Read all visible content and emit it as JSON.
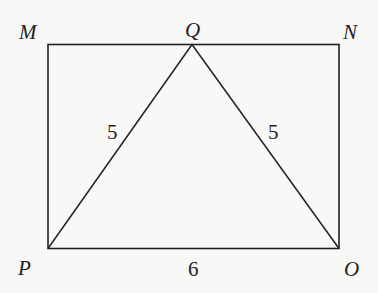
{
  "diagram": {
    "type": "geometry",
    "stroke_color": "#222222",
    "background_color": "#f8f8f6",
    "vertices": {
      "M": {
        "label": "M",
        "x": 48,
        "y": 44
      },
      "Q": {
        "label": "Q",
        "x": 192,
        "y": 44
      },
      "N": {
        "label": "N",
        "x": 339,
        "y": 44
      },
      "P": {
        "label": "P",
        "x": 48,
        "y": 248
      },
      "O": {
        "label": "O",
        "x": 339,
        "y": 248
      }
    },
    "segments": [
      {
        "from": "M",
        "to": "N",
        "role": "rectangle-top"
      },
      {
        "from": "N",
        "to": "O",
        "role": "rectangle-right"
      },
      {
        "from": "O",
        "to": "P",
        "role": "rectangle-bottom"
      },
      {
        "from": "P",
        "to": "M",
        "role": "rectangle-left"
      },
      {
        "from": "P",
        "to": "Q",
        "role": "triangle-left-side",
        "length_label": "5"
      },
      {
        "from": "Q",
        "to": "O",
        "role": "triangle-right-side",
        "length_label": "5"
      }
    ],
    "labels": {
      "M": "M",
      "Q": "Q",
      "N": "N",
      "P": "P",
      "O": "O",
      "PQ_length": "5",
      "QO_length": "5",
      "PO_length": "6"
    }
  }
}
